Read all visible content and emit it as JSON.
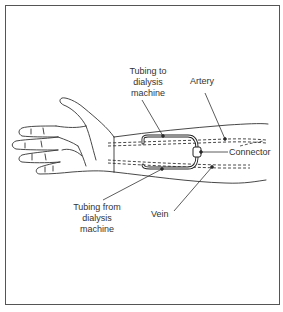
{
  "diagram": {
    "labels": {
      "tubing_to": "Tubing to\ndialysis\nmachine",
      "artery": "Artery",
      "connector": "Connector",
      "tubing_from": "Tubing from\ndialysis\nmachine",
      "vein": "Vein"
    },
    "colors": {
      "line": "#333333",
      "frame": "#555555",
      "background": "#ffffff"
    }
  }
}
